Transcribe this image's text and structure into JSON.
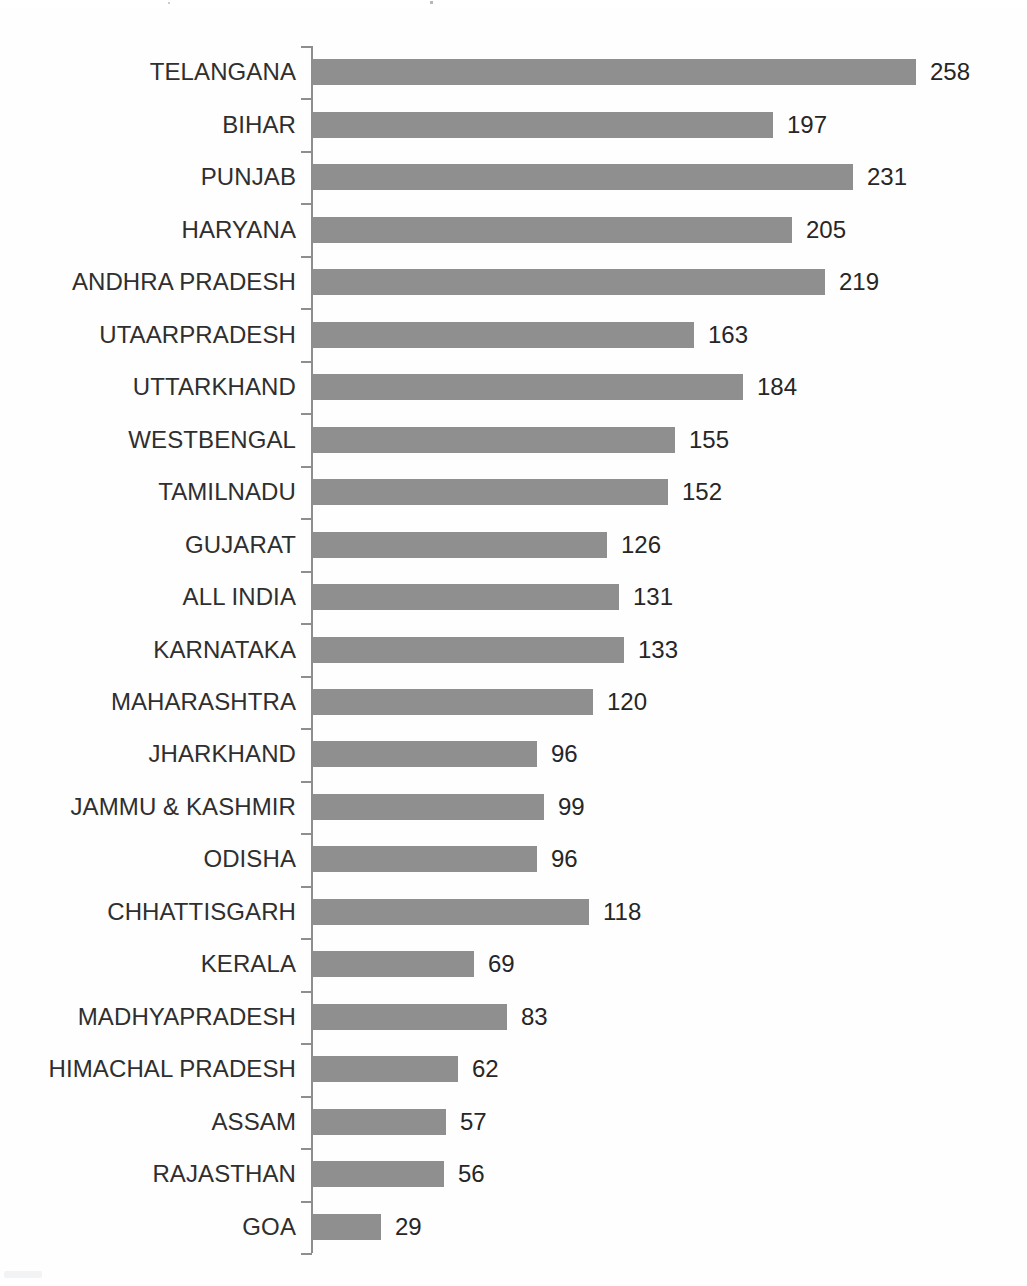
{
  "chart_data": {
    "type": "bar",
    "orientation": "horizontal",
    "title": "",
    "subtitle": "",
    "xlabel": "",
    "ylabel": "",
    "grid": false,
    "legend": null,
    "axis_line": true,
    "tick_marks": true,
    "value_labels": true,
    "xlim": [
      0,
      258
    ],
    "categories": [
      "TELANGANA",
      "BIHAR",
      "PUNJAB",
      "HARYANA",
      "ANDHRA PRADESH",
      "UTAARPRADESH",
      "UTTARKHAND",
      "WESTBENGAL",
      "TAMILNADU",
      "GUJARAT",
      "ALL INDIA",
      "KARNATAKA",
      "MAHARASHTRA",
      "JHARKHAND",
      "JAMMU & KASHMIR",
      "ODISHA",
      "CHHATTISGARH",
      "KERALA",
      "MADHYAPRADESH",
      "HIMACHAL PRADESH",
      "ASSAM",
      "RAJASTHAN",
      "GOA"
    ],
    "values": [
      258,
      197,
      231,
      205,
      219,
      163,
      184,
      155,
      152,
      126,
      131,
      133,
      120,
      96,
      99,
      96,
      118,
      69,
      83,
      62,
      57,
      56,
      29
    ],
    "bar_color": "#8f8f8f",
    "axis_color": "#8e8e8e",
    "label_color": "#2f2f2f",
    "value_color": "#262626"
  }
}
